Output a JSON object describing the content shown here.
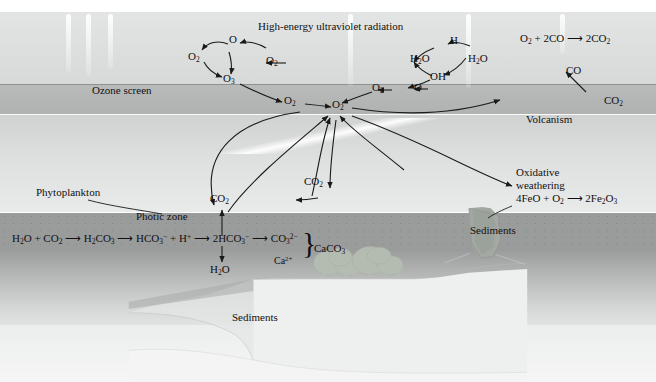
{
  "figure": {
    "title": "High-energy ultraviolet radiation",
    "domain": "atmospheric and oceanic carbon-oxygen cycle diagram"
  },
  "atmosphere": {
    "uv_label": "High-energy ultraviolet radiation",
    "ozone_screen_label": "Ozone screen",
    "ozone_cycle": {
      "o2_left": "O2",
      "o_top": "O",
      "o3": "O3",
      "o2_out": "O2",
      "o2_down": "O2"
    },
    "water_cycle": {
      "h": "H",
      "h2o_left": "H2O",
      "h2o_right": "H2O",
      "oh": "OH",
      "o": "O",
      "o2_feed": "O2"
    },
    "hub": "O2"
  },
  "volcano": {
    "reaction": "O2 + 2CO → 2CO2",
    "co_label": "CO",
    "co2_label": "CO2",
    "name_label": "Volcanism"
  },
  "land": {
    "trees_co2": "CO2",
    "oxidative_weathering_line1": "Oxidative",
    "oxidative_weathering_line2": "weathering",
    "oxidative_weathering_equation": "4FeO + O2 → 2Fe2O3",
    "sediments_label": "Sediments"
  },
  "ocean": {
    "phytoplankton_label": "Phytoplankton",
    "photic_zone_label": "Photic zone",
    "co2_up_label": "CO2",
    "sediments_label": "Sediments",
    "carbonate_chain": {
      "term1": "H2O + CO2",
      "term2": "H2CO3",
      "term3": "HCO3- + H+",
      "term4": "2HCO3-",
      "term5": "CO3 2-",
      "calcium": "Ca2+",
      "product": "CaCO3",
      "byproduct": "H2O"
    }
  },
  "colors": {
    "ozone_band": "#b4b6b6",
    "sky_top": "#dcdddd",
    "photic_zone": "#9a9c9c",
    "ink": "#111111",
    "volcano": "#9aa09a"
  }
}
